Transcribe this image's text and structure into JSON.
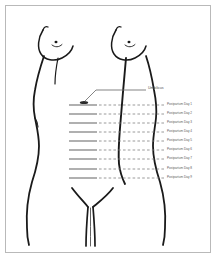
{
  "figure": {
    "border_color": "#b9b9b9",
    "background": "#ffffff",
    "outline_color": "#1a1a1a",
    "measure_line_color": "#808080",
    "label_color": "#5a5a5a"
  },
  "annotations": {
    "umbilicus": "Umbilicus"
  },
  "fundal_levels": [
    {
      "label": "Postpartum Day 1",
      "y": 105
    },
    {
      "label": "Postpartum Day 2",
      "y": 114
    },
    {
      "label": "Postpartum Day 3",
      "y": 123
    },
    {
      "label": "Postpartum Day 4",
      "y": 132
    },
    {
      "label": "Postpartum Day 5",
      "y": 141
    },
    {
      "label": "Postpartum Day 6",
      "y": 150
    },
    {
      "label": "Postpartum Day 7",
      "y": 159
    },
    {
      "label": "Postpartum Day 8",
      "y": 169
    },
    {
      "label": "Postpartum Day 9",
      "y": 178
    }
  ]
}
